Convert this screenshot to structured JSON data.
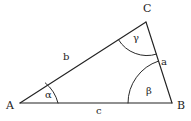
{
  "figure": {
    "kind": "triangle-diagram",
    "background_color": "#ffffff",
    "stroke_color": "#232323",
    "text_color": "#1d1d1d"
  },
  "vertices": [
    {
      "id": "A",
      "label": "A",
      "x": 20,
      "y": 103,
      "label_x": 6,
      "label_y": 100
    },
    {
      "id": "B",
      "label": "B",
      "x": 172,
      "y": 103,
      "label_x": 177,
      "label_y": 100
    },
    {
      "id": "C",
      "label": "C",
      "x": 146,
      "y": 22,
      "label_x": 143,
      "label_y": 3
    }
  ],
  "sides": [
    {
      "id": "b",
      "label": "b",
      "from": "A",
      "to": "C",
      "label_x": 63,
      "label_y": 52
    },
    {
      "id": "a",
      "label": "a",
      "from": "C",
      "to": "B",
      "label_x": 161,
      "label_y": 57
    },
    {
      "id": "c",
      "label": "c",
      "from": "A",
      "to": "B",
      "label_x": 96,
      "label_y": 106
    }
  ],
  "angles": [
    {
      "id": "alpha",
      "label": "α",
      "at_vertex": "A",
      "label_x": 45,
      "label_y": 90
    },
    {
      "id": "beta",
      "label": "β",
      "at_vertex": "B",
      "label_x": 146,
      "label_y": 86
    },
    {
      "id": "gamma",
      "label": "γ",
      "at_vertex": "C",
      "label_x": 133,
      "label_y": 33
    }
  ]
}
